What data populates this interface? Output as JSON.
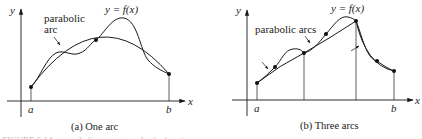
{
  "panels": [
    {
      "id": "a",
      "caption": "(a) One arc",
      "axis_labels": {
        "x": "x",
        "y": "y"
      },
      "endpoint_labels": {
        "left": "a",
        "right": "b"
      },
      "function_label": "y = f(x)",
      "annotation": [
        "parabolic",
        "arc"
      ],
      "num_arcs": 1
    },
    {
      "id": "b",
      "caption": "(b) Three arcs",
      "axis_labels": {
        "x": "x",
        "y": "y"
      },
      "endpoint_labels": {
        "left": "a",
        "right": "b"
      },
      "function_label": "y = f(x)",
      "annotation": [
        "parabolic arcs"
      ],
      "num_arcs": 3
    }
  ],
  "footer_caption_partial": "FIGURE 6.14  ... parabolic arcs ... graph of a function"
}
